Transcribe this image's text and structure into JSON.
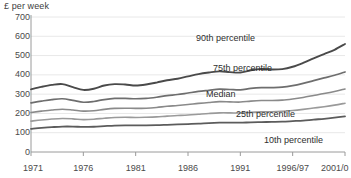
{
  "chart_data": {
    "type": "line",
    "title": "",
    "ylabel": "£ per week",
    "xlabel": "",
    "ylim": [
      0,
      700
    ],
    "grid": true,
    "legend_position": "inline-labels",
    "y_ticks": [
      0,
      100,
      200,
      300,
      400,
      500,
      600,
      700
    ],
    "x_tick_labels": [
      "1971",
      "1976",
      "1981",
      "1986",
      "1991",
      "1996/97",
      "2001/0"
    ],
    "x_tick_years": [
      1971,
      1976,
      1981,
      1986,
      1991,
      1996,
      2001
    ],
    "x": [
      1971,
      1972,
      1973,
      1974,
      1975,
      1976,
      1977,
      1978,
      1979,
      1980,
      1981,
      1982,
      1983,
      1984,
      1985,
      1986,
      1987,
      1988,
      1989,
      1990,
      1991,
      1992,
      1993,
      1994,
      1995,
      1996,
      1997,
      1998,
      1999,
      2000,
      2001
    ],
    "series": [
      {
        "name": "90th percentile",
        "color": "#4a4a4a",
        "width": 1.9,
        "label_x": 196,
        "label_y": 34,
        "values": [
          325,
          338,
          348,
          352,
          336,
          322,
          328,
          345,
          352,
          350,
          345,
          350,
          360,
          372,
          380,
          392,
          404,
          412,
          418,
          414,
          412,
          424,
          430,
          428,
          430,
          442,
          462,
          486,
          508,
          530,
          560
        ]
      },
      {
        "name": "75th percentile",
        "color": "#6e6e6e",
        "width": 1.7,
        "label_x": 213,
        "label_y": 64,
        "values": [
          255,
          264,
          272,
          276,
          268,
          258,
          262,
          272,
          278,
          278,
          276,
          278,
          284,
          292,
          298,
          306,
          314,
          320,
          326,
          324,
          322,
          330,
          334,
          334,
          336,
          344,
          356,
          370,
          384,
          398,
          415
        ]
      },
      {
        "name": "Median",
        "color": "#8a8a8a",
        "width": 1.6,
        "label_x": 206,
        "label_y": 90,
        "values": [
          205,
          212,
          218,
          222,
          218,
          212,
          214,
          221,
          226,
          227,
          226,
          227,
          231,
          237,
          241,
          246,
          252,
          257,
          261,
          260,
          259,
          264,
          267,
          267,
          269,
          275,
          283,
          293,
          303,
          314,
          327
        ]
      },
      {
        "name": "25th percentile",
        "color": "#9a9a9a",
        "width": 1.6,
        "label_x": 236,
        "label_y": 110,
        "values": [
          160,
          166,
          171,
          174,
          172,
          168,
          170,
          175,
          179,
          180,
          179,
          180,
          182,
          186,
          189,
          192,
          196,
          200,
          203,
          203,
          202,
          206,
          208,
          209,
          211,
          215,
          221,
          228,
          235,
          243,
          253
        ]
      },
      {
        "name": "10th percentile",
        "color": "#5c5c5c",
        "width": 1.8,
        "label_x": 264,
        "label_y": 136,
        "values": [
          120,
          125,
          129,
          132,
          132,
          130,
          131,
          134,
          137,
          138,
          138,
          138,
          139,
          141,
          143,
          145,
          147,
          150,
          152,
          152,
          152,
          154,
          155,
          156,
          157,
          160,
          163,
          168,
          172,
          178,
          185
        ]
      }
    ],
    "axis_color": "#9a9a9a",
    "grid_color": "#e8e8e8"
  }
}
